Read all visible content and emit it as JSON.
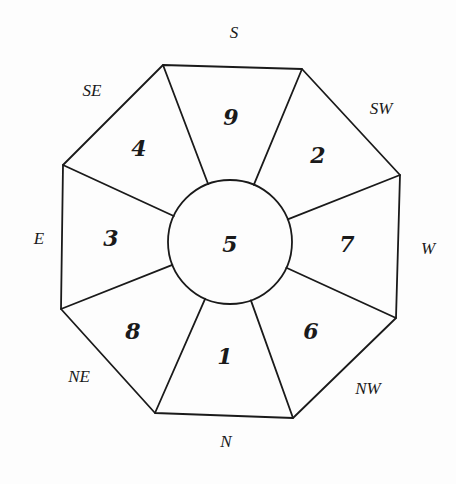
{
  "diagram": {
    "type": "octagonal-grid",
    "center": {
      "label": "5",
      "cx": 230,
      "cy": 242,
      "r": 62
    },
    "octagon_vertices": [
      [
        163,
        65
      ],
      [
        302,
        69
      ],
      [
        400,
        175
      ],
      [
        396,
        318
      ],
      [
        293,
        418
      ],
      [
        155,
        413
      ],
      [
        61,
        309
      ],
      [
        63,
        165
      ]
    ],
    "segments": [
      {
        "direction": "S",
        "number": "9",
        "x": 231,
        "y": 117
      },
      {
        "direction": "SW",
        "number": "2",
        "x": 318,
        "y": 155
      },
      {
        "direction": "W",
        "number": "7",
        "x": 347,
        "y": 244
      },
      {
        "direction": "NW",
        "number": "6",
        "x": 311,
        "y": 331
      },
      {
        "direction": "N",
        "number": "1",
        "x": 225,
        "y": 356
      },
      {
        "direction": "NE",
        "number": "8",
        "x": 133,
        "y": 331
      },
      {
        "direction": "E",
        "number": "3",
        "x": 111,
        "y": 238
      },
      {
        "direction": "SE",
        "number": "4",
        "x": 139,
        "y": 148
      }
    ],
    "direction_labels": [
      {
        "id": "S",
        "label": "S",
        "x": 234,
        "y": 32
      },
      {
        "id": "SW",
        "label": "SW",
        "x": 381,
        "y": 108
      },
      {
        "id": "W",
        "label": "W",
        "x": 428,
        "y": 248
      },
      {
        "id": "NW",
        "label": "NW",
        "x": 368,
        "y": 388
      },
      {
        "id": "N",
        "label": "N",
        "x": 226,
        "y": 441
      },
      {
        "id": "NE",
        "label": "NE",
        "x": 79,
        "y": 376
      },
      {
        "id": "E",
        "label": "E",
        "x": 39,
        "y": 238
      },
      {
        "id": "SE",
        "label": "SE",
        "x": 92,
        "y": 90
      }
    ]
  }
}
